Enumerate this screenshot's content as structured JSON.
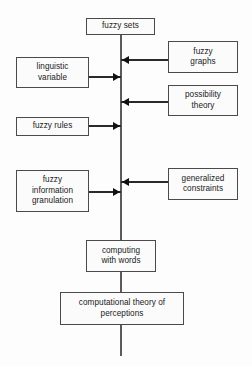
{
  "diagram": {
    "colors": {
      "background": "#fdfdfd",
      "box_fill": "#fbfbfb",
      "box_border": "#4a4a4a",
      "line": "#5b5b5b",
      "arrow": "#111111",
      "text": "#1a1a1a"
    },
    "spine": {
      "x": 121,
      "top": 35,
      "bottom": 356
    },
    "nodes": [
      {
        "id": "fuzzy-sets",
        "label": "fuzzy sets",
        "x": 86,
        "y": 18,
        "w": 69,
        "h": 17
      },
      {
        "id": "linguistic-variable",
        "label": "linguistic\nvariable",
        "x": 16,
        "y": 57,
        "w": 73,
        "h": 31
      },
      {
        "id": "fuzzy-graphs",
        "label": "fuzzy\ngraphs",
        "x": 168,
        "y": 41,
        "w": 70,
        "h": 32
      },
      {
        "id": "possibility-theory",
        "label": "possibility\ntheory",
        "x": 168,
        "y": 85,
        "w": 70,
        "h": 31
      },
      {
        "id": "fuzzy-rules",
        "label": "fuzzy rules",
        "x": 16,
        "y": 117,
        "w": 73,
        "h": 19
      },
      {
        "id": "fuzzy-information-granulation",
        "label": "fuzzy\ninformation\ngranulation",
        "x": 16,
        "y": 170,
        "w": 73,
        "h": 42
      },
      {
        "id": "generalized-constraints",
        "label": "generalized\nconstraints",
        "x": 168,
        "y": 168,
        "w": 70,
        "h": 32
      },
      {
        "id": "computing-with-words",
        "label": "computing\nwith words",
        "x": 86,
        "y": 240,
        "w": 70,
        "h": 32
      },
      {
        "id": "computational-theory-of-perceptions",
        "label": "computational theory of\nperceptions",
        "x": 60,
        "y": 292,
        "w": 124,
        "h": 33
      }
    ],
    "edges": [
      {
        "id": "fuzzy-graphs-to-spine",
        "direction": "left",
        "from": "fuzzy-graphs",
        "to": "spine",
        "y": 60,
        "x_start": 121,
        "x_end": 168
      },
      {
        "id": "linguistic-variable-to-spine",
        "direction": "right",
        "from": "linguistic-variable",
        "to": "spine",
        "y": 77,
        "x_start": 89,
        "x_end": 121
      },
      {
        "id": "possibility-theory-to-spine",
        "direction": "left",
        "from": "possibility-theory",
        "to": "spine",
        "y": 102,
        "x_start": 121,
        "x_end": 168
      },
      {
        "id": "fuzzy-rules-to-spine",
        "direction": "right",
        "from": "fuzzy-rules",
        "to": "spine",
        "y": 126,
        "x_start": 89,
        "x_end": 121
      },
      {
        "id": "generalized-constraints-to-spine",
        "direction": "left",
        "from": "generalized-constraints",
        "to": "spine",
        "y": 182,
        "x_start": 121,
        "x_end": 168
      },
      {
        "id": "fuzzy-information-granulation-to-spine",
        "direction": "right",
        "from": "fuzzy-information-granulation",
        "to": "spine",
        "y": 192,
        "x_start": 89,
        "x_end": 121
      }
    ]
  }
}
